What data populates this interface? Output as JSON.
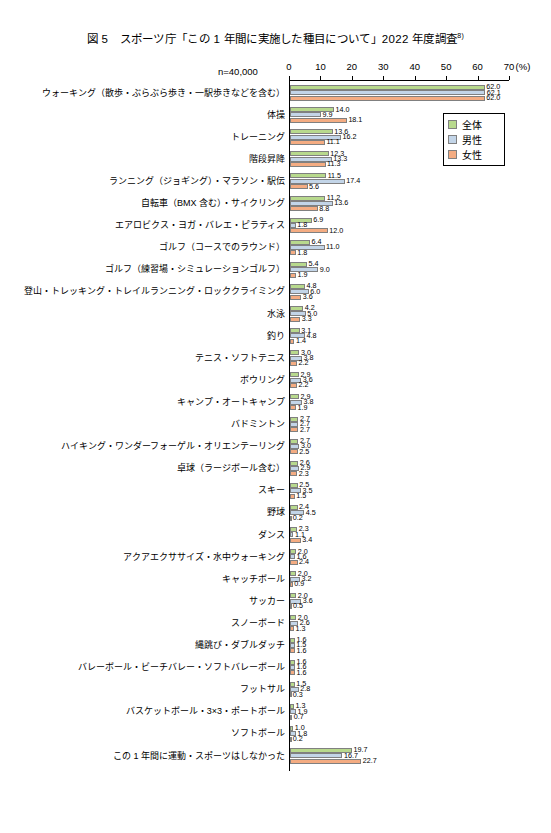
{
  "figure": {
    "title": "図 5　スポーツ庁「この 1 年間に実施した種目について」2022 年度調査",
    "title_superscript": "8)",
    "sample_note": "n=40,000"
  },
  "legend": {
    "items": [
      {
        "label": "全体",
        "color": "#b8d98d",
        "key": "total"
      },
      {
        "label": "男性",
        "color": "#c3d5e8",
        "key": "male"
      },
      {
        "label": "女性",
        "color": "#f4ac82",
        "key": "female"
      }
    ]
  },
  "axis": {
    "unit_label": "(%)",
    "ticks": [
      "0",
      "10",
      "20",
      "30",
      "40",
      "50",
      "60",
      "70"
    ],
    "min": 0,
    "max": 70
  },
  "chart_data": {
    "type": "bar",
    "orientation": "horizontal",
    "title": "図 5　スポーツ庁「この 1 年間に実施した種目について」2022 年度調査",
    "xlabel": "(%)",
    "ylabel": "",
    "xlim": [
      0,
      70
    ],
    "grid": false,
    "legend_position": "top-right",
    "sample_size": "n=40,000",
    "series": [
      {
        "name": "全体",
        "color": "#b8d98d"
      },
      {
        "name": "男性",
        "color": "#c3d5e8"
      },
      {
        "name": "女性",
        "color": "#f4ac82"
      }
    ],
    "categories": [
      "ウォーキング（散歩・ぶらぶら歩き・一駅歩きなどを含む）",
      "体操",
      "トレーニング",
      "階段昇降",
      "ランニング（ジョギング）・マラソン・駅伝",
      "自転車（BMX 含む）・サイクリング",
      "エアロビクス・ヨガ・バレエ・ピラティス",
      "ゴルフ（コースでのラウンド）",
      "ゴルフ（練習場・シミュレーションゴルフ）",
      "登山・トレッキング・トレイルランニング・ロッククライミング",
      "水泳",
      "釣り",
      "テニス・ソフトテニス",
      "ボウリング",
      "キャンプ・オートキャンプ",
      "バドミントン",
      "ハイキング・ワンダーフォーゲル・オリエンテーリング",
      "卓球（ラージボール含む）",
      "スキー",
      "野球",
      "ダンス",
      "アクアエクササイズ・水中ウォーキング",
      "キャッチボール",
      "サッカー",
      "スノーボード",
      "縄跳び・ダブルダッチ",
      "バレーボール・ビーチバレー・ソフトバレーボール",
      "フットサル",
      "バスケットボール・3×3・ポートボール",
      "ソフトボール",
      "この 1 年間に運動・スポーツはしなかった"
    ],
    "values": {
      "total": [
        62.0,
        14.0,
        13.6,
        12.3,
        11.5,
        11.2,
        6.9,
        6.4,
        5.4,
        4.8,
        4.2,
        3.1,
        3.0,
        2.9,
        2.9,
        2.7,
        2.7,
        2.6,
        2.5,
        2.4,
        2.3,
        2.0,
        2.0,
        2.0,
        2.0,
        1.6,
        1.6,
        1.5,
        1.3,
        1.0,
        19.7
      ],
      "male": [
        62.1,
        9.9,
        16.2,
        13.3,
        17.4,
        13.6,
        1.8,
        11.0,
        9.0,
        6.0,
        5.0,
        4.8,
        3.8,
        3.6,
        3.8,
        2.7,
        3.0,
        2.9,
        3.5,
        4.5,
        1.1,
        1.6,
        3.2,
        3.6,
        2.6,
        1.5,
        1.6,
        2.8,
        1.9,
        1.8,
        16.7
      ],
      "female": [
        62.0,
        18.1,
        11.1,
        11.3,
        5.6,
        8.8,
        12.0,
        1.8,
        1.9,
        3.6,
        3.3,
        1.4,
        2.2,
        2.2,
        1.9,
        2.7,
        2.5,
        2.3,
        1.5,
        0.2,
        3.4,
        2.4,
        0.9,
        0.5,
        1.3,
        1.6,
        1.6,
        0.3,
        0.7,
        0.2,
        22.7
      ]
    }
  }
}
